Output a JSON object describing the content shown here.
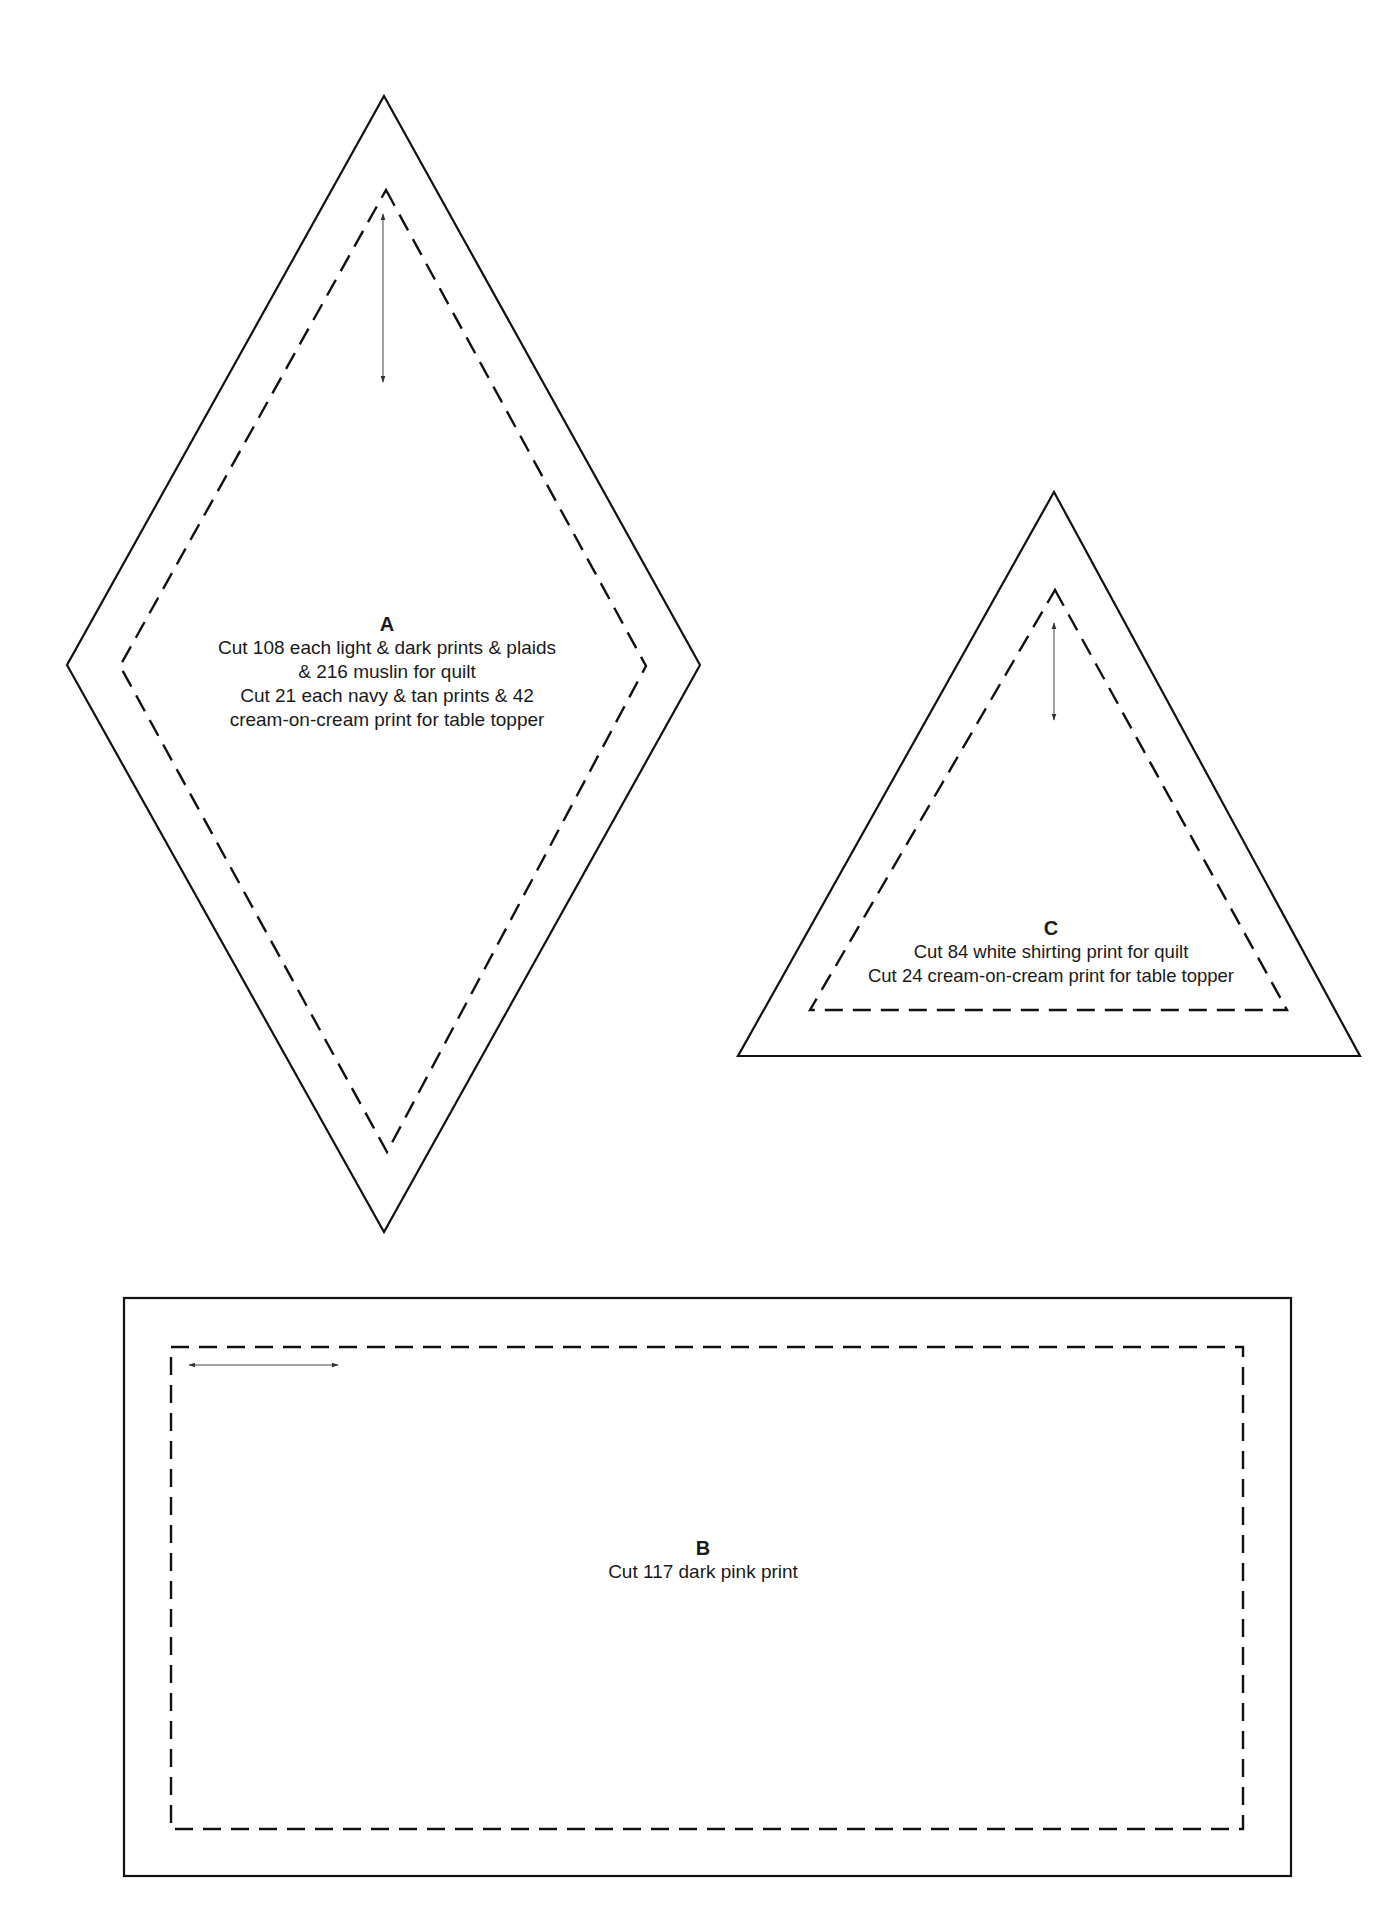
{
  "pieces": {
    "A": {
      "letter": "A",
      "shape": "diamond",
      "lines": [
        "Cut 108 each light & dark prints & plaids",
        "& 216 muslin for quilt",
        "Cut 21 each navy & tan prints & 42",
        "cream-on-cream print for table topper"
      ],
      "grain_arrow": "vertical"
    },
    "B": {
      "letter": "B",
      "shape": "rectangle",
      "lines": [
        "Cut 117 dark pink print"
      ],
      "grain_arrow": "horizontal"
    },
    "C": {
      "letter": "C",
      "shape": "triangle",
      "lines": [
        "Cut 84 white shirting print for quilt",
        "Cut 24 cream-on-cream print for table topper"
      ],
      "grain_arrow": "vertical"
    }
  },
  "colors": {
    "background": "#ffffff",
    "line": "#111111",
    "grain_arrow": "#444444",
    "text": "#1a1a1a"
  }
}
